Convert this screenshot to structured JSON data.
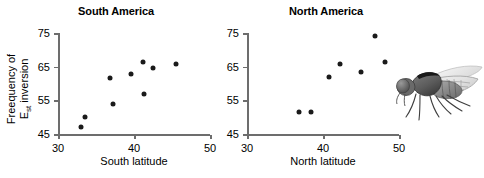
{
  "figure": {
    "ylabel_line1": "Freequency of",
    "ylabel_line2_main": "E",
    "ylabel_line2_sub": "st",
    "ylabel_line2_rest": " inversion",
    "dot_color": "#1a1a1a",
    "axis_color": "#6d6d6d"
  },
  "chart_data": [
    {
      "type": "scatter",
      "title": "South America",
      "xlabel": "South latitude",
      "ylabel": "Freequency of Est inversion",
      "xlim": [
        30,
        50
      ],
      "ylim": [
        45,
        75
      ],
      "xticks": [
        30,
        40,
        50
      ],
      "yticks": [
        45,
        55,
        65,
        75
      ],
      "grid": false,
      "legend": "none",
      "x": [
        33.0,
        33.6,
        36.8,
        37.2,
        39.6,
        41.2,
        41.3,
        42.5,
        45.5
      ],
      "y": [
        47.0,
        50.0,
        61.5,
        53.8,
        62.8,
        66.5,
        56.8,
        64.5,
        65.8
      ]
    },
    {
      "type": "scatter",
      "title": "North America",
      "xlabel": "North latitude",
      "ylabel": "Freequency of Est inversion",
      "xlim": [
        30,
        50
      ],
      "ylim": [
        45,
        75
      ],
      "xticks": [
        30,
        40,
        50
      ],
      "yticks": [
        45,
        55,
        65,
        75
      ],
      "grid": false,
      "legend": "none",
      "x": [
        36.9,
        38.4,
        40.8,
        42.3,
        45.0,
        46.8,
        48.2
      ],
      "y": [
        51.5,
        51.5,
        62.0,
        65.8,
        63.3,
        74.0,
        66.5
      ]
    }
  ],
  "illustration": {
    "name": "fruit-fly",
    "label": "Drosophila fly illustration"
  }
}
